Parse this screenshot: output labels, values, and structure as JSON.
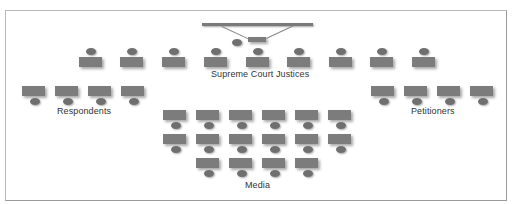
{
  "diagram": {
    "title": "",
    "colors": {
      "desk": "#7c7c7c",
      "head": "#6f6f6f",
      "border": "#b8b8b8",
      "label": "#333333"
    },
    "labels": {
      "justices": "Supreme Court Justices",
      "respondents": "Respondents",
      "petitioners": "Petitioners",
      "media": "Media"
    },
    "groups": {
      "chief_bench": {
        "seats": 1
      },
      "justices": {
        "seats": 9
      },
      "respondents": {
        "seats": 4
      },
      "petitioners": {
        "seats": 4
      },
      "media": {
        "rows": [
          6,
          6,
          4
        ],
        "seats": 16
      }
    }
  }
}
